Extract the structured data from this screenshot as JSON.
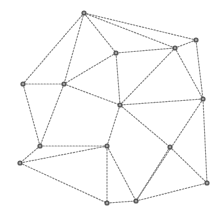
{
  "diagram": {
    "type": "network-graph",
    "edge_style": "dotted",
    "edge_color": "#8a8a8a",
    "node_color": "#444444",
    "nodes": [
      {
        "id": "n1",
        "x": 84,
        "y": 13
      },
      {
        "id": "n2",
        "x": 116,
        "y": 53
      },
      {
        "id": "n3",
        "x": 175,
        "y": 48
      },
      {
        "id": "n4",
        "x": 196,
        "y": 40
      },
      {
        "id": "n5",
        "x": 203,
        "y": 99
      },
      {
        "id": "n6",
        "x": 23,
        "y": 84
      },
      {
        "id": "n7",
        "x": 64,
        "y": 84
      },
      {
        "id": "n8",
        "x": 120,
        "y": 105
      },
      {
        "id": "n9",
        "x": 40,
        "y": 146
      },
      {
        "id": "n10",
        "x": 107,
        "y": 146
      },
      {
        "id": "n11",
        "x": 20,
        "y": 163
      },
      {
        "id": "n12",
        "x": 107,
        "y": 203
      },
      {
        "id": "n13",
        "x": 170,
        "y": 147
      },
      {
        "id": "n14",
        "x": 207,
        "y": 183
      },
      {
        "id": "n15",
        "x": 136,
        "y": 201
      }
    ],
    "edges": [
      [
        "n1",
        "n4"
      ],
      [
        "n1",
        "n3"
      ],
      [
        "n1",
        "n2"
      ],
      [
        "n1",
        "n7"
      ],
      [
        "n1",
        "n6"
      ],
      [
        "n2",
        "n3"
      ],
      [
        "n2",
        "n7"
      ],
      [
        "n2",
        "n8"
      ],
      [
        "n3",
        "n4"
      ],
      [
        "n3",
        "n8"
      ],
      [
        "n3",
        "n5"
      ],
      [
        "n4",
        "n5"
      ],
      [
        "n5",
        "n8"
      ],
      [
        "n5",
        "n14"
      ],
      [
        "n5",
        "n15"
      ],
      [
        "n6",
        "n7"
      ],
      [
        "n6",
        "n9"
      ],
      [
        "n7",
        "n8"
      ],
      [
        "n7",
        "n9"
      ],
      [
        "n8",
        "n10"
      ],
      [
        "n8",
        "n13"
      ],
      [
        "n9",
        "n10"
      ],
      [
        "n9",
        "n11"
      ],
      [
        "n10",
        "n11"
      ],
      [
        "n10",
        "n12"
      ],
      [
        "n10",
        "n15"
      ],
      [
        "n11",
        "n12"
      ],
      [
        "n12",
        "n15"
      ],
      [
        "n13",
        "n14"
      ],
      [
        "n13",
        "n15"
      ],
      [
        "n14",
        "n15"
      ]
    ]
  }
}
